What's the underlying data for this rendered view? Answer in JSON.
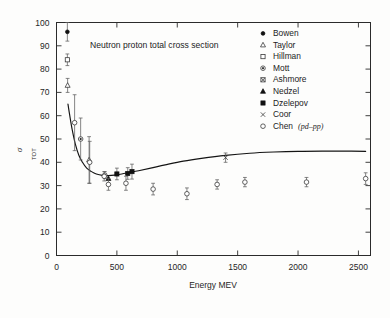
{
  "chart_data": {
    "type": "scatter",
    "title": "Neutron proton total cross section",
    "xlabel": "Energy  MEV",
    "ylabel": "σ",
    "ylabel_sub": "TOT",
    "xlim": [
      0,
      2600
    ],
    "ylim": [
      0,
      100
    ],
    "xticks": [
      0,
      500,
      1000,
      1500,
      2000,
      2500
    ],
    "xtick_labels": [
      "0",
      "500",
      "1000",
      "1500",
      "2000",
      "2500"
    ],
    "yticks": [
      0,
      10,
      20,
      30,
      40,
      50,
      60,
      70,
      80,
      90,
      100
    ],
    "ytick_labels": [
      "0",
      "10",
      "20",
      "30",
      "40",
      "50",
      "60",
      "70",
      "80",
      "90",
      "100"
    ],
    "grid": false,
    "legend_position": "upper-right-inside",
    "legend": [
      {
        "marker": "filled-circle",
        "label": "Bowen"
      },
      {
        "marker": "open-triangle",
        "label": "Taylor"
      },
      {
        "marker": "open-square",
        "label": "Hillman"
      },
      {
        "marker": "dotted-circle",
        "label": "Mott"
      },
      {
        "marker": "crossed-square",
        "label": "Ashmore"
      },
      {
        "marker": "filled-triangle",
        "label": "Nedzel"
      },
      {
        "marker": "filled-square",
        "label": "Dzelepov"
      },
      {
        "marker": "cross-x",
        "label": "Coor"
      },
      {
        "marker": "open-circle",
        "label": "Chen",
        "label_italic": "(pd–pp)"
      }
    ],
    "curve": {
      "name": "fitted total cross section",
      "x": [
        95,
        110,
        130,
        155,
        185,
        215,
        250,
        290,
        330,
        380,
        430,
        480,
        540,
        600,
        680,
        780,
        900,
        1050,
        1200,
        1400,
        1600,
        1800,
        2000,
        2200,
        2400,
        2560
      ],
      "y": [
        65.0,
        60.0,
        54.0,
        48.0,
        43.0,
        40.0,
        37.5,
        36.0,
        35.0,
        34.4,
        34.3,
        34.5,
        35.0,
        35.6,
        36.4,
        37.5,
        38.9,
        40.5,
        41.7,
        43.0,
        43.9,
        44.4,
        44.7,
        44.8,
        44.8,
        44.7
      ]
    },
    "series": [
      {
        "name": "Bowen",
        "marker": "filled-circle",
        "points": [
          {
            "x": 90,
            "y": 96.0,
            "yerr": 4.0
          }
        ]
      },
      {
        "name": "Hillman",
        "marker": "open-square",
        "points": [
          {
            "x": 90,
            "y": 84.0,
            "yerr": 2.5
          }
        ]
      },
      {
        "name": "Taylor",
        "marker": "open-triangle",
        "points": [
          {
            "x": 92,
            "y": 73.0,
            "yerr": 3.0
          },
          {
            "x": 270,
            "y": 41.0,
            "yerr": 10.0
          }
        ]
      },
      {
        "name": "Mott",
        "marker": "dotted-circle",
        "points": [
          {
            "x": 200,
            "y": 50.0,
            "yerr": 9.0
          },
          {
            "x": 400,
            "y": 34.5,
            "yerr": 1.5
          }
        ]
      },
      {
        "name": "Nedzel",
        "marker": "filled-triangle",
        "points": [
          {
            "x": 430,
            "y": 33.0,
            "yerr": 0.0
          }
        ]
      },
      {
        "name": "Dzelepov",
        "marker": "filled-square",
        "points": [
          {
            "x": 500,
            "y": 35.0,
            "yerr": 2.5
          },
          {
            "x": 590,
            "y": 35.2,
            "yerr": 2.5
          },
          {
            "x": 625,
            "y": 36.0,
            "yerr": 3.2
          }
        ]
      },
      {
        "name": "Coor",
        "marker": "cross-x",
        "points": [
          {
            "x": 1400,
            "y": 42.0,
            "yerr": 2.0
          }
        ]
      },
      {
        "name": "Chen (pd-pp)",
        "marker": "open-circle",
        "points": [
          {
            "x": 150,
            "y": 57.0,
            "yerr": 12.0
          },
          {
            "x": 275,
            "y": 40.0,
            "yerr": 9.0
          },
          {
            "x": 395,
            "y": 34.0,
            "yerr": 2.0
          },
          {
            "x": 430,
            "y": 30.5,
            "yerr": 2.5
          },
          {
            "x": 575,
            "y": 31.0,
            "yerr": 3.0
          },
          {
            "x": 800,
            "y": 28.5,
            "yerr": 2.5
          },
          {
            "x": 1080,
            "y": 26.5,
            "yerr": 2.5
          },
          {
            "x": 1330,
            "y": 30.5,
            "yerr": 2.0
          },
          {
            "x": 1560,
            "y": 31.5,
            "yerr": 2.0
          },
          {
            "x": 2070,
            "y": 31.5,
            "yerr": 2.0
          },
          {
            "x": 2560,
            "y": 33.0,
            "yerr": 2.5
          }
        ]
      }
    ]
  }
}
